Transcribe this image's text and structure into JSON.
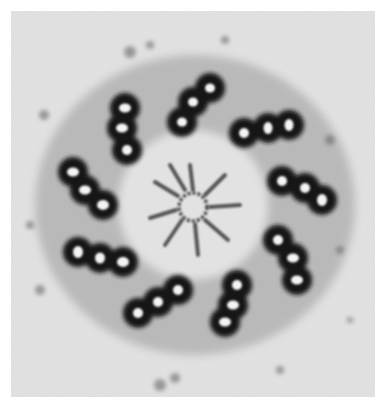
{
  "image": {
    "subject": "transmission electron micrograph, centriole cross-section",
    "description": "Nine microtubule triplets arranged in a ring around a central cartwheel hub with radiating spokes",
    "triplet_count": 9,
    "colors": {
      "border": "#ffffff",
      "background": "#e6e6e6",
      "stain": "#141414",
      "lumen": "#f2f2f2",
      "hub": "#5a5a5a"
    }
  }
}
